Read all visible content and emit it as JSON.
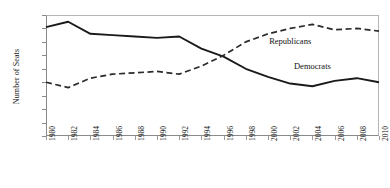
{
  "chart_data": {
    "type": "line",
    "title": "",
    "xlabel": "",
    "ylabel": "Number of Seats",
    "xlim": [
      1980,
      2010
    ],
    "ylim": [
      0,
      90
    ],
    "ytick_step": 10,
    "grid": false,
    "legend_position": "inline-annotation",
    "x": [
      1980,
      1982,
      1984,
      1986,
      1988,
      1990,
      1992,
      1994,
      1996,
      1998,
      2000,
      2002,
      2004,
      2006,
      2008,
      2010
    ],
    "yticks": [
      0,
      10,
      20,
      30,
      40,
      50,
      60,
      70,
      80,
      90
    ],
    "xticks": [
      "1980",
      "1982",
      "1984",
      "1986",
      "1988",
      "1990",
      "1992",
      "1994",
      "1996",
      "1998",
      "2000",
      "2002",
      "2004",
      "2006",
      "2008",
      "2010"
    ],
    "series": [
      {
        "name": "Democrats",
        "style": "solid",
        "color": "#1a1a1a",
        "label_x": 2004,
        "label_y": 52,
        "values": [
          81,
          85,
          76,
          75,
          74,
          73,
          74,
          65,
          59,
          50,
          44,
          39,
          37,
          41,
          43,
          40
        ]
      },
      {
        "name": "Republicans",
        "style": "dashed",
        "color": "#2b2b2b",
        "label_x": 2002,
        "label_y": 71,
        "values": [
          40,
          36,
          43,
          46,
          47,
          48,
          46,
          52,
          60,
          70,
          76,
          80,
          83,
          79,
          80,
          78
        ]
      }
    ]
  }
}
